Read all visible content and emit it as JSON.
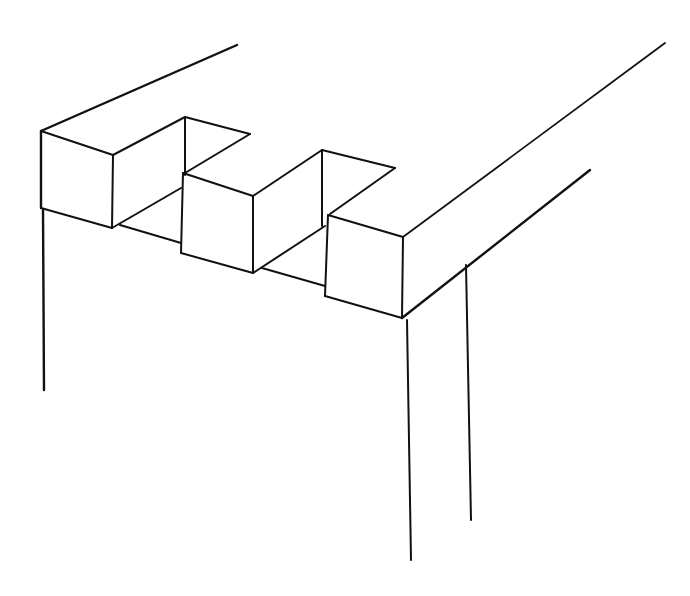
{
  "figure": {
    "title": "",
    "background": "#ffffff",
    "stroke_color": "#111111"
  },
  "lines": [
    {
      "name": "beam-top-back-edge",
      "x1": 41,
      "y1": 131,
      "x2": 237,
      "y2": 45,
      "w": 2.4
    },
    {
      "name": "block1-top-front-edge",
      "x1": 41,
      "y1": 131,
      "x2": 113,
      "y2": 155,
      "w": 2
    },
    {
      "name": "block1-front-right-edge",
      "x1": 113,
      "y1": 155,
      "x2": 112,
      "y2": 228,
      "w": 2
    },
    {
      "name": "block1-bottom-front-edge",
      "x1": 41,
      "y1": 208,
      "x2": 112,
      "y2": 228,
      "w": 2
    },
    {
      "name": "block1-front-left-edge",
      "x1": 41,
      "y1": 131,
      "x2": 41,
      "y2": 208,
      "w": 2.4
    },
    {
      "name": "block1-top-side-edge",
      "x1": 113,
      "y1": 155,
      "x2": 185,
      "y2": 117,
      "w": 2
    },
    {
      "name": "notch1-back-top-edge",
      "x1": 185,
      "y1": 117,
      "x2": 250,
      "y2": 134,
      "w": 2
    },
    {
      "name": "notch1-inner-vertical",
      "x1": 185,
      "y1": 117,
      "x2": 185,
      "y2": 175,
      "w": 2
    },
    {
      "name": "notch1-right-top-edge",
      "x1": 250,
      "y1": 134,
      "x2": 185,
      "y2": 173,
      "w": 2
    },
    {
      "name": "notch1-floor-side-edge",
      "x1": 112,
      "y1": 228,
      "x2": 181,
      "y2": 188,
      "w": 2
    },
    {
      "name": "notch1-floor-front-edge",
      "x1": 120,
      "y1": 225,
      "x2": 181,
      "y2": 243,
      "w": 2
    },
    {
      "name": "block2-top-front-edge",
      "x1": 183,
      "y1": 173,
      "x2": 253,
      "y2": 196,
      "w": 2
    },
    {
      "name": "block2-front-left-edge",
      "x1": 183,
      "y1": 173,
      "x2": 181,
      "y2": 253,
      "w": 2
    },
    {
      "name": "block2-front-right-edge",
      "x1": 253,
      "y1": 196,
      "x2": 253,
      "y2": 273,
      "w": 2
    },
    {
      "name": "block2-bottom-front-edge",
      "x1": 181,
      "y1": 253,
      "x2": 253,
      "y2": 273,
      "w": 2
    },
    {
      "name": "block2-top-side-edge",
      "x1": 253,
      "y1": 196,
      "x2": 322,
      "y2": 150,
      "w": 2
    },
    {
      "name": "notch2-back-top-edge",
      "x1": 322,
      "y1": 150,
      "x2": 395,
      "y2": 168,
      "w": 2
    },
    {
      "name": "notch2-inner-vertical",
      "x1": 322,
      "y1": 150,
      "x2": 322,
      "y2": 226,
      "w": 2
    },
    {
      "name": "notch2-right-top-edge",
      "x1": 395,
      "y1": 168,
      "x2": 330,
      "y2": 214,
      "w": 2
    },
    {
      "name": "notch2-floor-side-edge",
      "x1": 253,
      "y1": 273,
      "x2": 325,
      "y2": 226,
      "w": 2
    },
    {
      "name": "notch2-floor-front-edge",
      "x1": 262,
      "y1": 268,
      "x2": 325,
      "y2": 286,
      "w": 2
    },
    {
      "name": "block3-top-front-edge",
      "x1": 328,
      "y1": 215,
      "x2": 403,
      "y2": 237,
      "w": 2
    },
    {
      "name": "block3-front-left-edge",
      "x1": 328,
      "y1": 215,
      "x2": 325,
      "y2": 296,
      "w": 2
    },
    {
      "name": "block3-front-right-edge",
      "x1": 403,
      "y1": 237,
      "x2": 402,
      "y2": 318,
      "w": 2
    },
    {
      "name": "block3-bottom-front-edge",
      "x1": 325,
      "y1": 296,
      "x2": 402,
      "y2": 318,
      "w": 2
    },
    {
      "name": "beam-top-right-edge",
      "x1": 403,
      "y1": 237,
      "x2": 665,
      "y2": 43,
      "w": 1.8
    },
    {
      "name": "beam-bottom-right-edge",
      "x1": 402,
      "y1": 318,
      "x2": 590,
      "y2": 170,
      "w": 2.4
    },
    {
      "name": "left-post-edge",
      "x1": 43,
      "y1": 210,
      "x2": 44,
      "y2": 390,
      "w": 2.4
    },
    {
      "name": "front-post-edge",
      "x1": 407,
      "y1": 320,
      "x2": 411,
      "y2": 560,
      "w": 2
    },
    {
      "name": "back-post-edge",
      "x1": 466,
      "y1": 265,
      "x2": 471,
      "y2": 520,
      "w": 2
    }
  ]
}
